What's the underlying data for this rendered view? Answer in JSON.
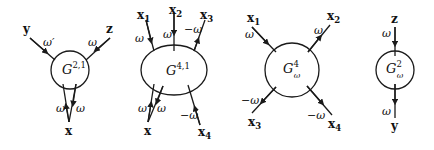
{
  "diagrams": [
    {
      "name": "G^{2,1}",
      "center_label": {
        "base": "G",
        "sup": "2,1",
        "sub": ""
      },
      "legs": [
        {
          "end": "y",
          "freq": "ω′",
          "dir": "in"
        },
        {
          "end": "z",
          "freq": "ω",
          "dir": "in"
        },
        {
          "end": "x",
          "freq": "ω",
          "dir": "in"
        },
        {
          "end": "x",
          "freq": "ω",
          "dir": "out"
        }
      ]
    },
    {
      "name": "G^{4,1}",
      "center_label": {
        "base": "G",
        "sup": "4,1",
        "sub": ""
      },
      "legs": [
        {
          "end": "x1",
          "label": "x",
          "index": "1",
          "freq": "ω",
          "dir": "in"
        },
        {
          "end": "x2",
          "label": "x",
          "index": "2",
          "freq": "ω",
          "dir": "in"
        },
        {
          "end": "x3",
          "label": "x",
          "index": "3",
          "freq": "−ω",
          "dir": "in"
        },
        {
          "end": "x",
          "label": "x",
          "index": "",
          "freq": "ω",
          "dir": "in"
        },
        {
          "end": "x",
          "label": "x",
          "index": "",
          "freq": "ω",
          "dir": "out"
        },
        {
          "end": "x4",
          "label": "x",
          "index": "4",
          "freq": "−ω",
          "dir": "in"
        }
      ]
    },
    {
      "name": "G^4_ω",
      "center_label": {
        "base": "G",
        "sup": "4",
        "sub": "ω"
      },
      "legs": [
        {
          "end": "x1",
          "label": "x",
          "index": "1",
          "freq": "ω",
          "dir": "in"
        },
        {
          "end": "x2",
          "label": "x",
          "index": "2",
          "freq": "ω",
          "dir": "in"
        },
        {
          "end": "x3",
          "label": "x",
          "index": "3",
          "freq": "−ω",
          "dir": "in"
        },
        {
          "end": "x4",
          "label": "x",
          "index": "4",
          "freq": "−ω",
          "dir": "in"
        }
      ]
    },
    {
      "name": "G^2_ω",
      "center_label": {
        "base": "G",
        "sup": "2",
        "sub": "ω"
      },
      "legs": [
        {
          "end": "z",
          "label": "z",
          "freq": "ω",
          "dir": "in"
        },
        {
          "end": "y",
          "label": "y",
          "freq": "ω",
          "dir": "out"
        }
      ]
    }
  ],
  "labels": {
    "d1": {
      "y": "y",
      "z": "z",
      "x": "x",
      "w_y": "ω′",
      "w_z": "ω",
      "w_x1": "ω",
      "w_x2": "ω",
      "G": "G",
      "sup": "2,1"
    },
    "d2": {
      "x1": "x",
      "i1": "1",
      "x2": "x",
      "i2": "2",
      "x3": "x",
      "i3": "3",
      "x": "x",
      "x4": "x",
      "i4": "4",
      "w1": "ω",
      "w2": "ω",
      "w3": "−ω",
      "wa": "ω",
      "wb": "ω",
      "w4": "−ω",
      "G": "G",
      "sup": "4,1"
    },
    "d3": {
      "x1": "x",
      "i1": "1",
      "x2": "x",
      "i2": "2",
      "x3": "x",
      "i3": "3",
      "x4": "x",
      "i4": "4",
      "w1": "ω",
      "w2": "ω",
      "w3": "−ω",
      "w4": "−ω",
      "G": "G",
      "sup": "4",
      "sub": "ω"
    },
    "d4": {
      "z": "z",
      "y": "y",
      "wz": "ω",
      "wy": "ω",
      "G": "G",
      "sup": "2",
      "sub": "ω"
    }
  }
}
